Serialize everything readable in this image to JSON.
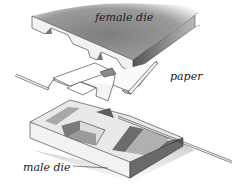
{
  "diagram": {
    "labels": {
      "female_die": "female die",
      "paper": "paper",
      "male_die": "male die"
    },
    "colors": {
      "die_top": "#8a8a8a",
      "die_face_light": "#f2f2f2",
      "die_face_dark": "#6a6a6a",
      "shadow": "#d0d0d0",
      "paper": "#ffffff",
      "outline": "#333333"
    }
  }
}
